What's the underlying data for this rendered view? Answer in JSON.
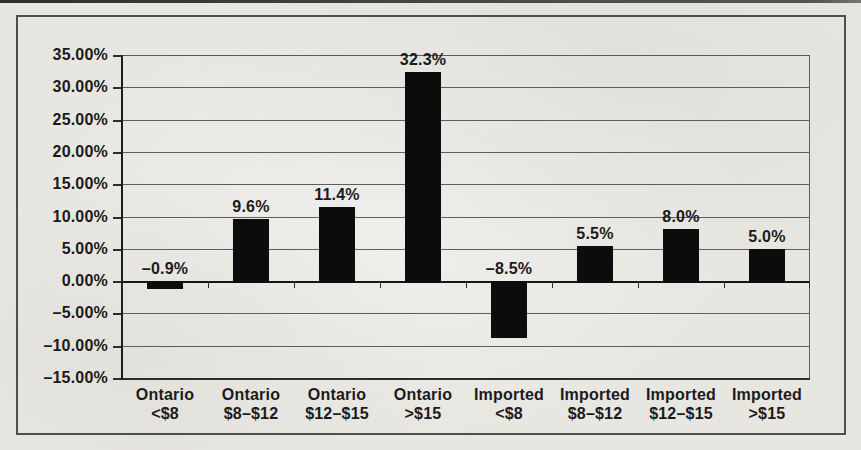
{
  "chart_data": {
    "type": "bar",
    "categories": [
      {
        "line1": "Ontario",
        "line2": "<$8"
      },
      {
        "line1": "Ontario",
        "line2": "$8–$12"
      },
      {
        "line1": "Ontario",
        "line2": "$12–$15"
      },
      {
        "line1": "Ontario",
        "line2": ">$15"
      },
      {
        "line1": "Imported",
        "line2": "<$8"
      },
      {
        "line1": "Imported",
        "line2": "$8–$12"
      },
      {
        "line1": "Imported",
        "line2": "$12–$15"
      },
      {
        "line1": "Imported",
        "line2": ">$15"
      }
    ],
    "values": [
      -0.9,
      9.6,
      11.4,
      32.3,
      -8.5,
      5.5,
      8.0,
      5.0
    ],
    "value_labels": [
      "–0.9%",
      "9.6%",
      "11.4%",
      "32.3%",
      "–8.5%",
      "5.5%",
      "8.0%",
      "5.0%"
    ],
    "y_axis": {
      "min": -15,
      "max": 35,
      "step": 5,
      "tick_labels": [
        "35.00%",
        "30.00%",
        "25.00%",
        "20.00%",
        "15.00%",
        "10.00%",
        "5.00%",
        "0.00%",
        "–5.00%",
        "–10.00%",
        "–15.00%"
      ]
    },
    "grid": true,
    "legend": "none",
    "bar_color": "#0c0c0c",
    "xlabel": "",
    "ylabel": ""
  }
}
